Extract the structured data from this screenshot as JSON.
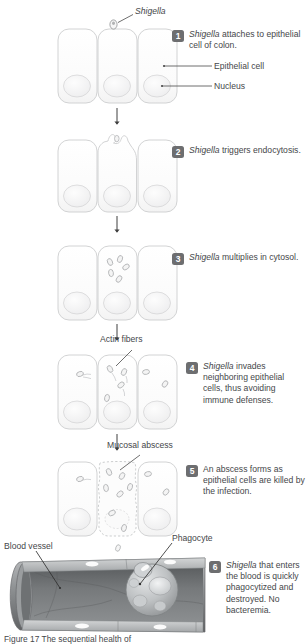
{
  "figure": {
    "title_caption": "Figure 17 The sequential health of",
    "organism": "Shigella"
  },
  "callouts": {
    "shigella": "Shigella",
    "epithelial_cell": "Epithelial cell",
    "nucleus": "Nucleus",
    "actin_fibers": "Actin fibers",
    "mucosal_abscess": "Mucosal abscess",
    "blood_vessel": "Blood vessel",
    "phagocyte": "Phagocyte"
  },
  "steps": [
    {
      "number": "1",
      "italic_lead": "Shigella",
      "text": " attaches to epithelial cell of colon."
    },
    {
      "number": "2",
      "italic_lead": "Shigella",
      "text": " triggers endocytosis."
    },
    {
      "number": "3",
      "italic_lead": "Shigella",
      "text": " multiplies in cytosol."
    },
    {
      "number": "4",
      "italic_lead": "Shigella",
      "text": " invades neighboring epithelial cells, thus avoiding immune defenses."
    },
    {
      "number": "5",
      "italic_lead": "",
      "text": "An abscess forms as epithelial cells are killed by the infection."
    },
    {
      "number": "6",
      "italic_lead": "Shigella",
      "text": " that enters the blood is quickly phagocytized and destroyed. No bacteremia."
    }
  ],
  "colors": {
    "badge": "#6d6e70",
    "text": "#45474a",
    "cell_outline": "#c9cacb",
    "cell_fill": "#fafafa",
    "nucleus_fill": "#f2f2f2",
    "bacterium_outline": "#a9abad",
    "vessel_dark": "#6a6c6e",
    "vessel_mid": "#8d9092",
    "vessel_light": "#c2c4c5",
    "leader_line": "#4a4a4a"
  }
}
